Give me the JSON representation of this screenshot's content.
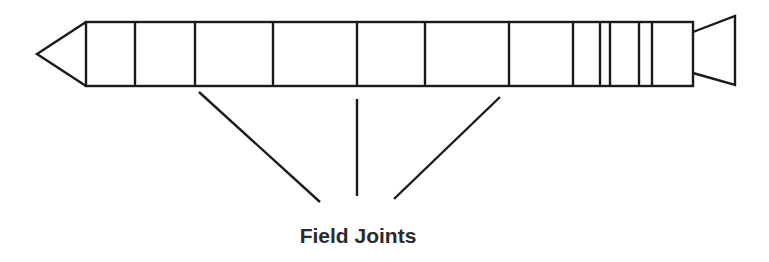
{
  "diagram": {
    "label": "Field Joints",
    "stroke_color": "#1a1a1a",
    "text_color": "#2a2a2a",
    "body": {
      "x_start": 86,
      "x_end": 693,
      "y_top": 22,
      "y_bottom": 86
    },
    "nose": {
      "tip_x": 37,
      "tip_y": 54
    },
    "nozzle": {
      "x_start": 693,
      "x_end": 735,
      "inner_top": 32,
      "inner_bottom": 73,
      "outer_top": 16,
      "outer_bottom": 85
    },
    "segment_dividers_x": [
      135,
      195,
      273,
      357,
      425,
      509,
      573,
      600,
      610,
      639,
      652
    ],
    "pointer_lines": [
      {
        "name": "left",
        "x1": 199,
        "y1": 92,
        "x2": 320,
        "y2": 202
      },
      {
        "name": "center",
        "x1": 357,
        "y1": 99,
        "x2": 357,
        "y2": 196
      },
      {
        "name": "right",
        "x1": 500,
        "y1": 97,
        "x2": 394,
        "y2": 199
      }
    ]
  }
}
